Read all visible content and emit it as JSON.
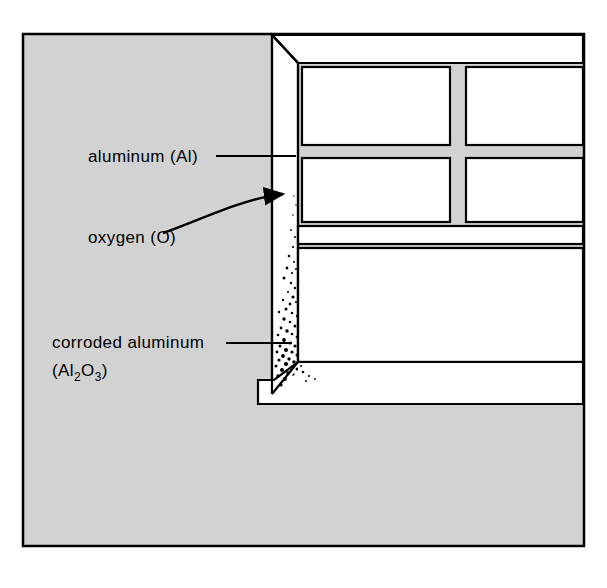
{
  "figure": {
    "background_color": "#ffffff",
    "panel_fill": "#d2d2d2",
    "structure_fill": "#ffffff",
    "line_color": "#000000"
  },
  "labels": {
    "aluminum": {
      "text": "aluminum (Al)",
      "x": 88,
      "y": 162
    },
    "oxygen": {
      "text": "oxygen (O)",
      "x": 88,
      "y": 243
    },
    "corroded": {
      "line1": "corroded aluminum",
      "line2_open": "(Al",
      "line2_sub1": "2",
      "line2_mid": "O",
      "line2_sub2": "3",
      "line2_close": ")",
      "x": 52,
      "y1": 348,
      "y2": 375
    }
  },
  "annotations": {
    "aluminum_leader": "straight leader line from label to frame member",
    "oxygen_arrow": "curved arrow from oxygen label to frame surface",
    "corroded_leader": "straight leader line from label to corroded region"
  },
  "icons": {
    "arrowhead": "arrow-head-icon"
  }
}
